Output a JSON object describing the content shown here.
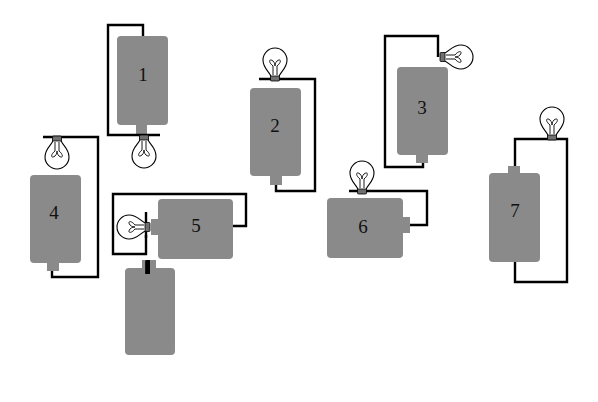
{
  "diagram": {
    "title": "",
    "colors": {
      "background": "#ffffff",
      "battery": "#8a8a8a",
      "wire": "#000000",
      "bulb_outline": "#000000"
    },
    "circuits": [
      {
        "id": 1,
        "label": "1"
      },
      {
        "id": 2,
        "label": "2"
      },
      {
        "id": 3,
        "label": "3"
      },
      {
        "id": 4,
        "label": "4"
      },
      {
        "id": 5,
        "label": "5"
      },
      {
        "id": 6,
        "label": "6"
      },
      {
        "id": 7,
        "label": "7"
      },
      {
        "id": 8,
        "label": "8"
      },
      {
        "id": 9,
        "label": "9"
      },
      {
        "id": 10,
        "label": "10"
      }
    ]
  }
}
